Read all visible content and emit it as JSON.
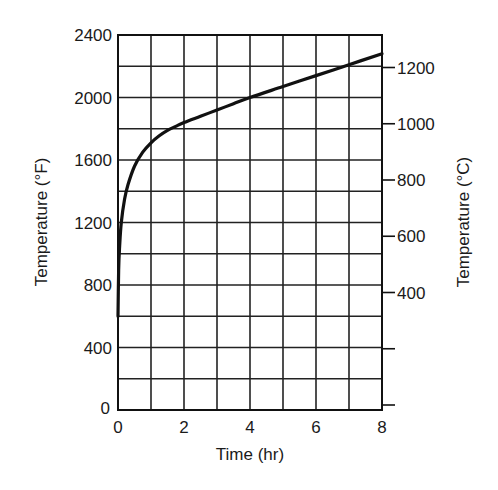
{
  "chart_data": {
    "type": "line",
    "title": "",
    "xlabel": "Time (hr)",
    "ylabel": "Temperature (°F)",
    "y2label": "Temperature (°C)",
    "xlim": [
      0,
      8
    ],
    "ylim": [
      0,
      2400
    ],
    "grid": true,
    "legend": null,
    "x_ticks": [
      0,
      2,
      4,
      6,
      8
    ],
    "x_tick_labels": [
      "0",
      "2",
      "4",
      "6",
      "8"
    ],
    "x_gridlines": [
      0,
      1,
      2,
      3,
      4,
      5,
      6,
      7,
      8
    ],
    "y_ticks": [
      0,
      400,
      800,
      1200,
      1600,
      2000,
      2400
    ],
    "y_tick_labels": [
      "0",
      "400",
      "800",
      "1200",
      "1600",
      "2000",
      "2400"
    ],
    "y_gridlines": [
      0,
      200,
      400,
      600,
      800,
      1000,
      1200,
      1400,
      1600,
      1800,
      2000,
      2200,
      2400
    ],
    "y2_ticks": [
      {
        "celsius": 1200,
        "label": "1200"
      },
      {
        "celsius": 1000,
        "label": "1000"
      },
      {
        "celsius": 800,
        "label": "800"
      },
      {
        "celsius": 600,
        "label": "600"
      },
      {
        "celsius": 400,
        "label": "400"
      },
      {
        "celsius": 200,
        "label": ""
      },
      {
        "celsius": 0,
        "label": ""
      }
    ],
    "series": [
      {
        "name": "Temperature",
        "color": "#111111",
        "x": [
          0,
          0.02,
          0.05,
          0.1,
          0.2,
          0.3,
          0.5,
          0.75,
          1.0,
          1.25,
          1.5,
          1.75,
          2.0,
          2.5,
          3.0,
          3.5,
          4.0,
          5.0,
          6.0,
          7.0,
          8.0
        ],
        "y": [
          600,
          900,
          1050,
          1200,
          1350,
          1440,
          1560,
          1650,
          1710,
          1755,
          1790,
          1815,
          1840,
          1880,
          1920,
          1960,
          2000,
          2070,
          2140,
          2210,
          2280
        ]
      }
    ]
  }
}
